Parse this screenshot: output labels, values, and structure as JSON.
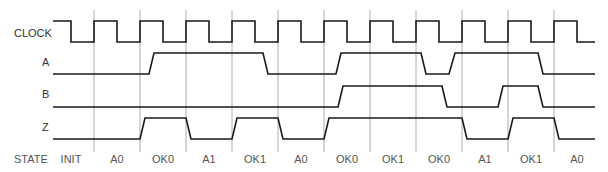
{
  "diagram": {
    "type": "timing-diagram",
    "signal_labels": [
      "CLOCK",
      "A",
      "B",
      "Z"
    ],
    "state_label": "STATE",
    "states": [
      "INIT",
      "A0",
      "OK0",
      "A1",
      "OK1",
      "A0",
      "OK0",
      "OK1",
      "OK0",
      "A1",
      "OK1",
      "A0"
    ],
    "signals": {
      "CLOCK": "square wave, rising edges aligned with state boundaries",
      "A": [
        0,
        0,
        1,
        1,
        1,
        0,
        0,
        1,
        1,
        1,
        1,
        0
      ],
      "B": [
        0,
        0,
        0,
        0,
        0,
        0,
        0,
        1,
        1,
        0,
        1,
        0
      ],
      "Z": [
        0,
        0,
        1,
        0,
        1,
        0,
        1,
        1,
        1,
        0,
        1,
        0
      ]
    },
    "colors": {
      "waveform": "#1a1a1a",
      "gridline": "#9a9a9a",
      "text": "#555555"
    }
  }
}
